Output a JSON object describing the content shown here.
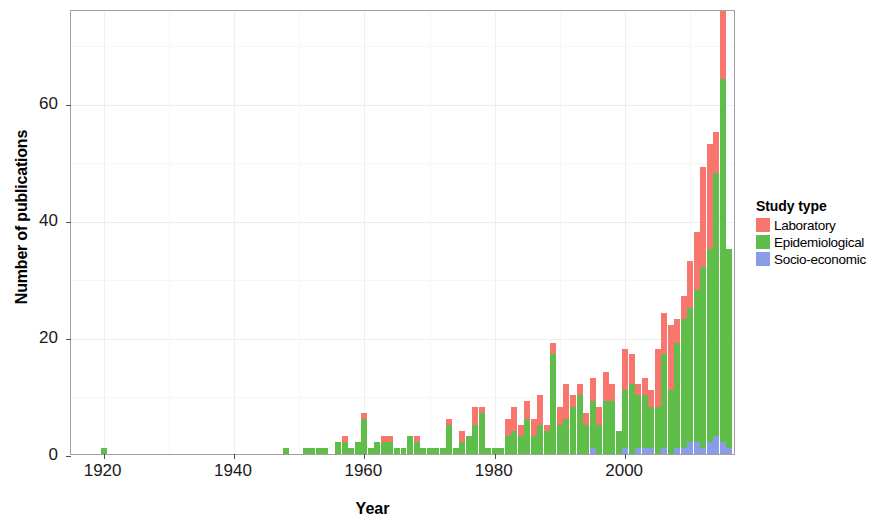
{
  "chart_data": {
    "type": "bar",
    "stacked": true,
    "title": "",
    "xlabel": "Year",
    "ylabel": "Number of publications",
    "xlim": [
      1915,
      2017
    ],
    "ylim": [
      0,
      76
    ],
    "xticks": [
      1920,
      1940,
      1960,
      1980,
      2000
    ],
    "yticks": [
      0,
      20,
      40,
      60
    ],
    "grid": true,
    "legend": {
      "title": "Study type",
      "position": "right",
      "entries": [
        {
          "label": "Laboratory",
          "color": "#F8766D"
        },
        {
          "label": "Epidemiological",
          "color": "#5FBE4A"
        },
        {
          "label": "Socio-economic",
          "color": "#8A9BE8"
        }
      ]
    },
    "series": [
      {
        "name": "Socio-economic",
        "color": "#8A9BE8"
      },
      {
        "name": "Epidemiological",
        "color": "#5FBE4A"
      },
      {
        "name": "Laboratory",
        "color": "#F8766D"
      }
    ],
    "x": [
      1920,
      1948,
      1951,
      1952,
      1953,
      1954,
      1956,
      1957,
      1958,
      1959,
      1960,
      1961,
      1962,
      1963,
      1964,
      1965,
      1966,
      1967,
      1968,
      1969,
      1970,
      1971,
      1972,
      1973,
      1974,
      1975,
      1976,
      1977,
      1978,
      1979,
      1980,
      1981,
      1982,
      1983,
      1984,
      1985,
      1986,
      1987,
      1988,
      1989,
      1990,
      1991,
      1992,
      1993,
      1994,
      1995,
      1996,
      1997,
      1998,
      1999,
      2000,
      2001,
      2002,
      2003,
      2004,
      2005,
      2006,
      2007,
      2008,
      2009,
      2010,
      2011,
      2012,
      2013,
      2014,
      2015,
      2016
    ],
    "values": {
      "Epidemiological": [
        1,
        1,
        1,
        1,
        1,
        1,
        2,
        2,
        1,
        2,
        6,
        1,
        2,
        2,
        2,
        1,
        1,
        3,
        2,
        1,
        1,
        1,
        1,
        5,
        1,
        2,
        3,
        5,
        7,
        1,
        1,
        1,
        3,
        4,
        3,
        6,
        3,
        5,
        4,
        17,
        5,
        6,
        8,
        10,
        5,
        8,
        5,
        9,
        9,
        4,
        10,
        12,
        9,
        9,
        7,
        8,
        16,
        11,
        18,
        22,
        23,
        26,
        31,
        33,
        45,
        62,
        34
      ],
      "Laboratory": [
        0,
        0,
        0,
        0,
        0,
        0,
        0,
        1,
        0,
        0,
        1,
        0,
        0,
        1,
        1,
        0,
        0,
        0,
        1,
        0,
        0,
        0,
        0,
        1,
        0,
        2,
        0,
        3,
        1,
        0,
        0,
        0,
        3,
        4,
        2,
        3,
        3,
        5,
        1,
        2,
        3,
        6,
        2,
        2,
        2,
        4,
        3,
        5,
        3,
        0,
        7,
        5,
        2,
        3,
        3,
        10,
        7,
        11,
        4,
        4,
        8,
        10,
        17,
        18,
        7,
        13,
        0
      ],
      "Socio-economic": [
        0,
        0,
        0,
        0,
        0,
        0,
        0,
        0,
        0,
        0,
        0,
        0,
        0,
        0,
        0,
        0,
        0,
        0,
        0,
        0,
        0,
        0,
        0,
        0,
        0,
        0,
        0,
        0,
        0,
        0,
        0,
        0,
        0,
        0,
        0,
        0,
        0,
        0,
        0,
        0,
        0,
        0,
        0,
        0,
        0,
        1,
        0,
        0,
        0,
        0,
        1,
        0,
        1,
        1,
        1,
        0,
        1,
        0,
        1,
        1,
        2,
        2,
        1,
        2,
        3,
        2,
        1
      ]
    }
  },
  "axis": {
    "x_title": "Year",
    "y_title": "Number of publications",
    "x_tick_labels": [
      "1920",
      "1940",
      "1960",
      "1980",
      "2000"
    ],
    "y_tick_labels": [
      "0",
      "20",
      "40",
      "60"
    ]
  },
  "legend": {
    "title": "Study type",
    "items": [
      {
        "label": "Laboratory",
        "color": "#F8766D"
      },
      {
        "label": "Epidemiological",
        "color": "#5FBE4A"
      },
      {
        "label": "Socio-economic",
        "color": "#8A9BE8"
      }
    ]
  }
}
